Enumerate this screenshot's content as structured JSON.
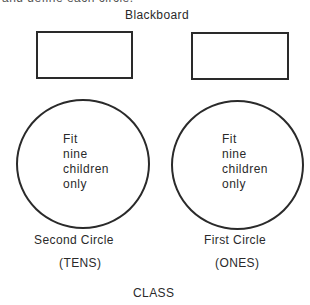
{
  "clipped_caption": "and define each circle.",
  "blackboard": {
    "label": "Blackboard"
  },
  "circles": [
    {
      "name": "Second Circle",
      "place": "(TENS)",
      "lines": [
        "Fit",
        "nine",
        "children",
        "only"
      ]
    },
    {
      "name": "First Circle",
      "place": "(ONES)",
      "lines": [
        "Fit",
        "nine",
        "children",
        "only"
      ]
    }
  ],
  "footer": {
    "label": "CLASS"
  },
  "colors": {
    "stroke": "#2a2a2a",
    "background": "#ffffff"
  }
}
